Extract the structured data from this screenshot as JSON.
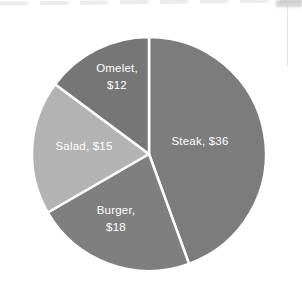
{
  "page": {
    "background": "#ffffff"
  },
  "chart_data": {
    "type": "pie",
    "title": "",
    "currency_unit": "$",
    "total": 81,
    "start_angle": "12-oclock",
    "direction": "clockwise",
    "separator_color": "#ffffff",
    "legend": "none",
    "labels_inside_slices": true,
    "slices": [
      {
        "name": "Steak",
        "value": 36,
        "label": "Steak, $36",
        "label_lines": [
          "Steak, $36"
        ],
        "color": "#7c7c7c",
        "text_color": "#ffffff"
      },
      {
        "name": "Burger",
        "value": 18,
        "label": "Burger, $18",
        "label_lines": [
          "Burger,",
          "$18"
        ],
        "color": "#7f7f7f",
        "text_color": "#ffffff"
      },
      {
        "name": "Salad",
        "value": 15,
        "label": "Salad, $15",
        "label_lines": [
          "Salad, $15"
        ],
        "color": "#b3b3b3",
        "text_color": "#ffffff"
      },
      {
        "name": "Omelet",
        "value": 12,
        "label": "Omelet, $12",
        "label_lines": [
          "Omelet,",
          "$12"
        ],
        "color": "#767676",
        "text_color": "#ffffff"
      }
    ]
  }
}
